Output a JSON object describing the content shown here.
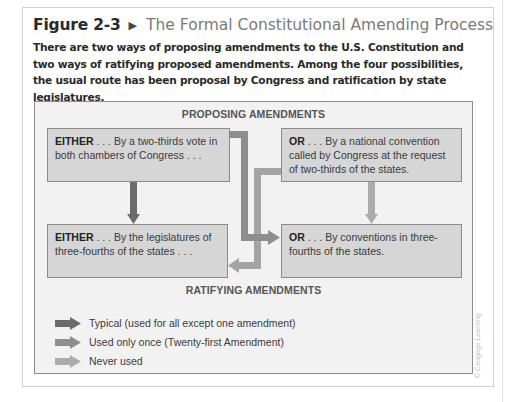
{
  "figure": {
    "number": "Figure 2-3",
    "title": "The Formal Constitutional Amending Process",
    "caption": "There are two ways of proposing amendments to the U.S. Constitution and two ways of ratifying proposed amendments. Among the four possibilities, the usual route has been proposal by Congress and ratification by state legislatures."
  },
  "diagram": {
    "top_label": "PROPOSING AMENDMENTS",
    "bottom_label": "RATIFYING AMENDMENTS",
    "boxes": [
      {
        "lead": "EITHER",
        "text": " . . . By a two-thirds vote in both chambers of Congress . . ."
      },
      {
        "lead": "OR",
        "text": " . . . By a national convention called by Congress at the request of two-thirds of the states."
      },
      {
        "lead": "EITHER",
        "text": " . . . By the legislatures of three-fourths of the states . . ."
      },
      {
        "lead": "OR",
        "text": " . . . By conventions in three-fourths of the states."
      }
    ],
    "colors": {
      "typical": "#6b6b6b",
      "once": "#8e8e8e",
      "never": "#acacac",
      "box_fill": "#d6d6d6",
      "panel_fill": "#f2f2f2"
    }
  },
  "legend": [
    {
      "label": "Typical (used for all except one amendment)",
      "key": "typical"
    },
    {
      "label": "Used only once (Twenty-first Amendment)",
      "key": "once"
    },
    {
      "label": "Never used",
      "key": "never"
    }
  ],
  "credit": "© Cengage Learning"
}
